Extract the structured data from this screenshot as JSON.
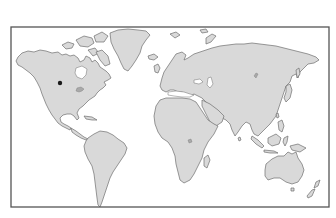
{
  "map": {
    "type": "world-outline-map",
    "projection": "equirectangular-like",
    "colors": {
      "background": "#ffffff",
      "land": "#d9d9d9",
      "coastline": "#6e6e6e",
      "frame": "#555555",
      "marker": "#1a1a1a"
    },
    "frame": {
      "x": 11,
      "y": 27,
      "width": 318,
      "height": 180
    },
    "markers": [
      {
        "name": "location-marker",
        "region": "North America (central Canada / northern US plains)",
        "x": 60,
        "y": 83,
        "radius": 2.2
      }
    ],
    "continents": [
      "North America",
      "Greenland",
      "South America",
      "Europe",
      "Africa",
      "Asia",
      "Australia",
      "New Zealand",
      "Antarctica-not-shown"
    ]
  }
}
